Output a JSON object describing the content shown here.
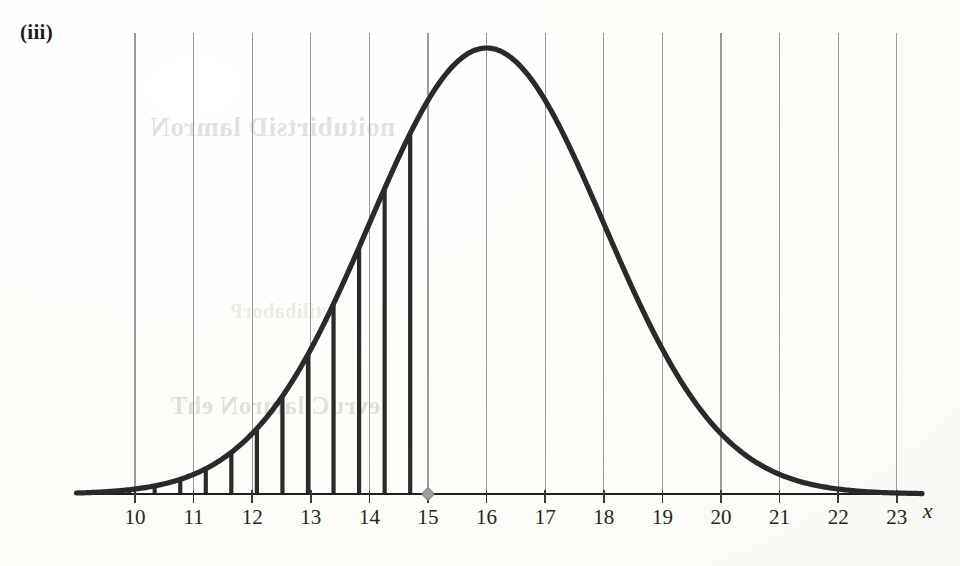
{
  "figure": {
    "panel_label": "(iii)",
    "axis_label_x": "x",
    "background_color": "#fdfdfb",
    "curve_color": "#2a2a2a",
    "gridline_color": "#9a9a9a",
    "axis_color": "#1f1f1f",
    "marker_color": "#9d9d9d",
    "bleed_through_text": {
      "line1": "noitubirtsiD lamroN",
      "line2": "evruC lamroN ehT",
      "line3": "ytilibaborP"
    }
  },
  "chart_data": {
    "type": "line",
    "title": "",
    "subtitle": "",
    "xlabel": "x",
    "ylabel": "",
    "grid": true,
    "legend_position": "none",
    "xlim": [
      9.0,
      23.6
    ],
    "ylim": [
      0,
      1.05
    ],
    "x_ticks": [
      10,
      11,
      12,
      13,
      14,
      15,
      16,
      17,
      18,
      19,
      20,
      21,
      22,
      23
    ],
    "x_tick_labels": [
      "10",
      "11",
      "12",
      "13",
      "14",
      "15",
      "16",
      "17",
      "18",
      "19",
      "20",
      "21",
      "22",
      "23"
    ],
    "y_ticks": [],
    "y_tick_labels": [],
    "distribution": {
      "kind": "normal",
      "mean": 16,
      "std_dev": 2.0,
      "peak_x": 16,
      "peak_y": 1.0
    },
    "shaded_region": {
      "style": "vertical-hatch-bars",
      "from_x": 9.9,
      "to_x": 15,
      "bar_spacing_x": 0.436,
      "description": "Region under the normal curve from the left tail up to x = 15, filled with vertical hatching lines."
    },
    "markers": [
      {
        "x": 15,
        "y": 0,
        "shape": "diamond",
        "label": "15"
      }
    ],
    "series": [
      {
        "name": "Normal density",
        "x": [
          9.0,
          9.5,
          10.0,
          10.5,
          11.0,
          11.5,
          12.0,
          12.5,
          13.0,
          13.5,
          14.0,
          14.5,
          15.0,
          15.5,
          16.0,
          16.5,
          17.0,
          17.5,
          18.0,
          18.5,
          19.0,
          19.5,
          20.0,
          20.5,
          21.0,
          21.5,
          22.0,
          22.5,
          23.0,
          23.5
        ],
        "values": [
          0.0004,
          0.0019,
          0.0088,
          0.0277,
          0.0439,
          0.0796,
          0.1353,
          0.2163,
          0.3247,
          0.4578,
          0.6065,
          0.7548,
          0.8825,
          0.9692,
          1.0,
          0.9692,
          0.8825,
          0.7548,
          0.6065,
          0.4578,
          0.3247,
          0.2163,
          0.1353,
          0.0796,
          0.0439,
          0.0227,
          0.0111,
          0.0051,
          0.0022,
          0.0009
        ]
      }
    ]
  }
}
